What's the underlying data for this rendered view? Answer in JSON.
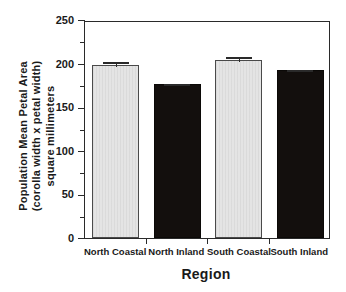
{
  "chart_data": {
    "type": "bar",
    "title": "",
    "subtitle": "",
    "xlabel": "Region",
    "ylabel_lines": [
      "Population Mean Petal Area",
      "(corolla width x petal width)",
      "square millimeters"
    ],
    "ylabel": "Population Mean Petal Area (corolla width x petal width) square millimeters",
    "categories": [
      "North  Coastal",
      "North  Inland",
      "South  Coastal",
      "South  Inland"
    ],
    "values": [
      198,
      177,
      204,
      193
    ],
    "errors": [
      6,
      2,
      6,
      2
    ],
    "bar_fills": [
      "light",
      "dark",
      "light",
      "dark"
    ],
    "ylim": [
      0,
      250
    ],
    "yticks": [
      0,
      50,
      100,
      150,
      200,
      250
    ],
    "ytick_labels": [
      "0",
      "50",
      "100",
      "150",
      "200",
      "250"
    ],
    "yminor_ticks": [
      25,
      75,
      125,
      175,
      225
    ],
    "grid": false,
    "legend": false,
    "legend_position": "none",
    "colors": {
      "light_bar": "#e4e4e4",
      "dark_bar": "#130f0d",
      "axis": "#2a2a2a",
      "text": "#1a1a1a",
      "background": "#ffffff"
    }
  }
}
